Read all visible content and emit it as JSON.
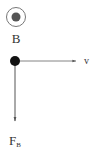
{
  "diagram": {
    "field": {
      "label": "B",
      "symbol": "out-of-page (dot in circle)"
    },
    "velocity": {
      "label": "v",
      "direction": "right"
    },
    "force": {
      "label": "F",
      "subscript": "B",
      "direction": "down"
    },
    "colors": {
      "line": "#444444",
      "dot": "#111111",
      "field_dot": "#555555"
    }
  }
}
